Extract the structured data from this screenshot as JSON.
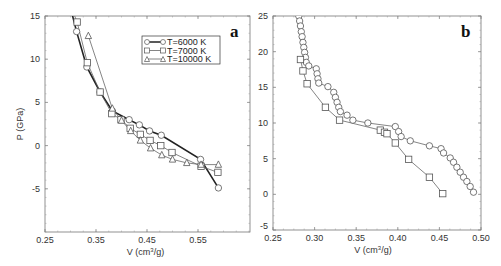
{
  "chart_data": [
    {
      "panel": "a",
      "type": "line",
      "xlabel": "V (cm³/g)",
      "ylabel": "P (GPa)",
      "xlim": [
        0.25,
        0.62
      ],
      "ylim": [
        -10,
        15
      ],
      "xticks": [
        "0.25",
        "0.35",
        "0.45",
        "0.55"
      ],
      "yticks": [
        "15",
        "10",
        "5",
        "0",
        "-5"
      ],
      "grid": false,
      "legend_position": "upper right",
      "series": [
        {
          "name": "T=6000 K",
          "marker": "circle",
          "line": "thick",
          "points": [
            [
              0.302,
              15.5
            ],
            [
              0.312,
              13.2
            ],
            [
              0.332,
              9.1
            ],
            [
              0.358,
              6.2
            ],
            [
              0.382,
              4.0
            ],
            [
              0.415,
              3.0
            ],
            [
              0.435,
              2.4
            ],
            [
              0.455,
              1.7
            ],
            [
              0.478,
              1.2
            ],
            [
              0.555,
              -1.6
            ],
            [
              0.59,
              -4.9
            ]
          ]
        },
        {
          "name": "T=7000 K",
          "marker": "square",
          "line": "thin",
          "points": [
            [
              0.305,
              15.5
            ],
            [
              0.313,
              14.3
            ],
            [
              0.333,
              9.6
            ],
            [
              0.358,
              6.2
            ],
            [
              0.381,
              3.7
            ],
            [
              0.399,
              3.0
            ],
            [
              0.417,
              2.0
            ],
            [
              0.437,
              1.3
            ],
            [
              0.456,
              0.6
            ],
            [
              0.477,
              0.0
            ],
            [
              0.499,
              -0.8
            ],
            [
              0.556,
              -2.4
            ],
            [
              0.589,
              -3.1
            ]
          ]
        },
        {
          "name": "T=10000 K",
          "marker": "triangle",
          "line": "thin",
          "points": [
            [
              0.335,
              12.7
            ],
            [
              0.382,
              4.3
            ],
            [
              0.4,
              2.9
            ],
            [
              0.418,
              1.7
            ],
            [
              0.437,
              0.6
            ],
            [
              0.457,
              -0.3
            ],
            [
              0.479,
              -1.1
            ],
            [
              0.5,
              -1.6
            ],
            [
              0.528,
              -2.0
            ],
            [
              0.556,
              -2.2
            ],
            [
              0.59,
              -2.2
            ]
          ]
        }
      ],
      "annotations": [
        "a"
      ]
    },
    {
      "panel": "b",
      "type": "line",
      "xlabel": "V (cm³/g)",
      "ylabel": "",
      "xlim": [
        0.25,
        0.5
      ],
      "ylim": [
        -5,
        25
      ],
      "xticks": [
        "0.25",
        "0.30",
        "0.35",
        "0.40",
        "0.45",
        "0.50"
      ],
      "yticks": [
        "25",
        "20",
        "15",
        "10",
        "5",
        "0",
        "-5"
      ],
      "grid": false,
      "series": [
        {
          "name": "circles",
          "marker": "circle",
          "points": [
            [
              0.281,
              25.0
            ],
            [
              0.282,
              24.3
            ],
            [
              0.283,
              23.6
            ],
            [
              0.284,
              22.8
            ],
            [
              0.285,
              22.1
            ],
            [
              0.286,
              21.3
            ],
            [
              0.287,
              20.6
            ],
            [
              0.288,
              19.9
            ],
            [
              0.289,
              19.2
            ],
            [
              0.29,
              18.5
            ],
            [
              0.293,
              18.0
            ],
            [
              0.302,
              17.6
            ],
            [
              0.303,
              16.9
            ],
            [
              0.304,
              16.2
            ],
            [
              0.305,
              15.6
            ],
            [
              0.316,
              15.1
            ],
            [
              0.323,
              14.3
            ],
            [
              0.325,
              13.6
            ],
            [
              0.327,
              12.9
            ],
            [
              0.329,
              12.2
            ],
            [
              0.331,
              11.6
            ],
            [
              0.339,
              11.1
            ],
            [
              0.346,
              10.4
            ],
            [
              0.364,
              10.0
            ],
            [
              0.397,
              9.5
            ],
            [
              0.401,
              8.8
            ],
            [
              0.404,
              8.1
            ],
            [
              0.415,
              7.5
            ],
            [
              0.438,
              6.8
            ],
            [
              0.452,
              6.4
            ],
            [
              0.455,
              5.8
            ],
            [
              0.463,
              5.1
            ],
            [
              0.467,
              4.5
            ],
            [
              0.471,
              3.8
            ],
            [
              0.475,
              3.1
            ],
            [
              0.479,
              2.4
            ],
            [
              0.483,
              1.8
            ],
            [
              0.487,
              1.1
            ],
            [
              0.491,
              0.3
            ]
          ]
        },
        {
          "name": "squares",
          "marker": "square",
          "points": [
            [
              0.283,
              18.9
            ],
            [
              0.286,
              17.3
            ],
            [
              0.291,
              15.5
            ],
            [
              0.313,
              12.2
            ],
            [
              0.33,
              10.4
            ],
            [
              0.379,
              9.0
            ],
            [
              0.384,
              8.7
            ],
            [
              0.387,
              8.5
            ],
            [
              0.397,
              7.2
            ],
            [
              0.413,
              4.9
            ],
            [
              0.438,
              2.4
            ],
            [
              0.454,
              0.1
            ]
          ]
        }
      ],
      "annotations": [
        "b"
      ]
    }
  ],
  "panel_a": {
    "label": "a",
    "ylabel": "P (GPa)",
    "xlabel_main": "V (cm",
    "xlabel_sup": "3",
    "xlabel_tail": "/g)",
    "legend": [
      "T=6000 K",
      "T=7000 K",
      "T=10000 K"
    ]
  },
  "panel_b": {
    "label": "b",
    "xlabel_main": "V (cm",
    "xlabel_sup": "3",
    "xlabel_tail": "/g)"
  }
}
